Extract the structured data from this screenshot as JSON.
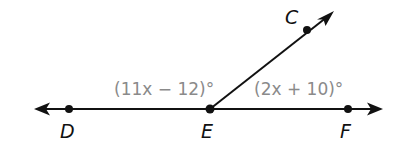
{
  "diagram": {
    "type": "linear-pair-angles",
    "points": {
      "C": {
        "label": "C",
        "x": 307,
        "y": 30
      },
      "D": {
        "label": "D",
        "x": 69,
        "y": 109
      },
      "E": {
        "label": "E",
        "x": 210,
        "y": 109
      },
      "F": {
        "label": "F",
        "x": 348,
        "y": 109
      }
    },
    "angles": {
      "DEC": {
        "label": "(11x − 12)°"
      },
      "CEF": {
        "label": "(2x + 10)°"
      }
    },
    "colors": {
      "lines": "#111111",
      "angle_labels": "#8a8a8a",
      "background": "#ffffff"
    }
  }
}
